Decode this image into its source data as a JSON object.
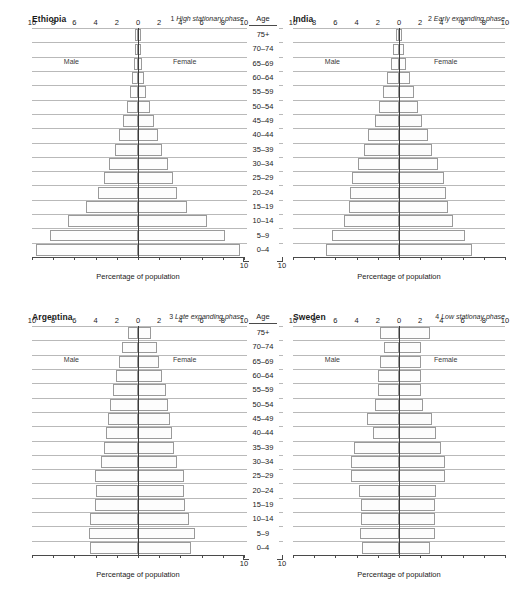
{
  "figure": {
    "age_header": "Age",
    "age_groups": [
      "75+",
      "70–74",
      "65–69",
      "60–64",
      "55–59",
      "50–54",
      "45–49",
      "40–44",
      "35–39",
      "30–34",
      "25–29",
      "20–24",
      "15–19",
      "10–14",
      "5–9",
      "0–4"
    ],
    "male_label": "Male",
    "female_label": "Female",
    "x_title": "Percentage of population",
    "x_ticks": [
      "10",
      "8",
      "6",
      "4",
      "2",
      "0",
      "2",
      "4",
      "6",
      "8",
      "10"
    ],
    "x_tick_values": [
      -10,
      -8,
      -6,
      -4,
      -2,
      0,
      2,
      4,
      6,
      8,
      10
    ],
    "xlim": [
      -10,
      10
    ],
    "colors": {
      "bar_fill": "#fdfdfd",
      "bar_stroke": "#9a9a9a",
      "gridline": "#b9b9b9",
      "center_axis": "#3a3a3a",
      "text": "#1a1a1a"
    }
  },
  "chart_data": [
    {
      "type": "bar",
      "panel": 1,
      "title": "Ethiopia",
      "phase_number": "1",
      "phase_label": "High stationary phase",
      "xlabel": "Percentage of population",
      "ylabel": "Age",
      "xlim": [
        -10,
        10
      ],
      "categories": [
        "75+",
        "70–74",
        "65–69",
        "60–64",
        "55–59",
        "50–54",
        "45–49",
        "40–44",
        "35–39",
        "30–34",
        "25–29",
        "20–24",
        "15–19",
        "10–14",
        "5–9",
        "0–4"
      ],
      "series": [
        {
          "name": "Male",
          "values": [
            0.25,
            0.3,
            0.4,
            0.55,
            0.75,
            1.0,
            1.4,
            1.8,
            2.2,
            2.7,
            3.2,
            3.8,
            4.9,
            6.6,
            8.3,
            9.6
          ]
        },
        {
          "name": "Female",
          "values": [
            0.25,
            0.3,
            0.4,
            0.55,
            0.8,
            1.1,
            1.5,
            1.9,
            2.3,
            2.8,
            3.3,
            3.7,
            4.6,
            6.5,
            8.2,
            9.6
          ]
        }
      ]
    },
    {
      "type": "bar",
      "panel": 2,
      "title": "India",
      "phase_number": "2",
      "phase_label": "Early expanding phase",
      "xlabel": "Percentage of population",
      "ylabel": "Age",
      "xlim": [
        -10,
        10
      ],
      "categories": [
        "75+",
        "70–74",
        "65–69",
        "60–64",
        "55–59",
        "50–54",
        "45–49",
        "40–44",
        "35–39",
        "30–34",
        "25–29",
        "20–24",
        "15–19",
        "10–14",
        "5–9",
        "0–4"
      ],
      "series": [
        {
          "name": "Male",
          "values": [
            0.25,
            0.55,
            0.75,
            1.1,
            1.5,
            1.9,
            2.3,
            2.9,
            3.3,
            3.9,
            4.4,
            4.6,
            4.7,
            5.2,
            6.3,
            6.9
          ]
        },
        {
          "name": "Female",
          "values": [
            0.25,
            0.5,
            0.7,
            1.0,
            1.4,
            1.8,
            2.2,
            2.7,
            3.1,
            3.7,
            4.2,
            4.4,
            4.6,
            5.1,
            6.2,
            6.9
          ]
        }
      ]
    },
    {
      "type": "bar",
      "panel": 3,
      "title": "Argentina",
      "phase_number": "3",
      "phase_label": "Late expanding phase",
      "xlabel": "Percentage of population",
      "ylabel": "Age",
      "xlim": [
        -10,
        10
      ],
      "categories": [
        "75+",
        "70–74",
        "65–69",
        "60–64",
        "55–59",
        "50–54",
        "45–49",
        "40–44",
        "35–39",
        "30–34",
        "25–29",
        "20–24",
        "15–19",
        "10–14",
        "5–9",
        "0–4"
      ],
      "series": [
        {
          "name": "Male",
          "values": [
            0.9,
            1.5,
            1.8,
            2.1,
            2.4,
            2.6,
            2.8,
            3.0,
            3.2,
            3.5,
            4.1,
            4.0,
            4.1,
            4.5,
            4.6,
            4.5
          ]
        },
        {
          "name": "Female",
          "values": [
            1.2,
            1.8,
            2.0,
            2.3,
            2.6,
            2.8,
            3.0,
            3.2,
            3.4,
            3.7,
            4.3,
            4.3,
            4.4,
            4.8,
            5.4,
            5.0
          ]
        }
      ]
    },
    {
      "type": "bar",
      "panel": 4,
      "title": "Sweden",
      "phase_number": "4",
      "phase_label": "Low stationay phase",
      "xlabel": "Percentage of population",
      "ylabel": "Age",
      "xlim": [
        -10,
        10
      ],
      "categories": [
        "75+",
        "70–74",
        "65–69",
        "60–64",
        "55–59",
        "50–54",
        "45–49",
        "40–44",
        "35–39",
        "30–34",
        "25–29",
        "20–24",
        "15–19",
        "10–14",
        "5–9",
        "0–4"
      ],
      "series": [
        {
          "name": "Male",
          "values": [
            1.8,
            1.4,
            1.8,
            2.0,
            2.0,
            2.3,
            3.0,
            2.5,
            4.2,
            4.5,
            4.5,
            3.8,
            3.6,
            3.6,
            3.7,
            3.5
          ]
        },
        {
          "name": "Female",
          "values": [
            2.9,
            2.1,
            2.1,
            2.1,
            2.1,
            2.3,
            3.1,
            3.5,
            4.0,
            4.3,
            4.3,
            3.5,
            3.4,
            3.4,
            3.4,
            2.9
          ]
        }
      ]
    }
  ]
}
